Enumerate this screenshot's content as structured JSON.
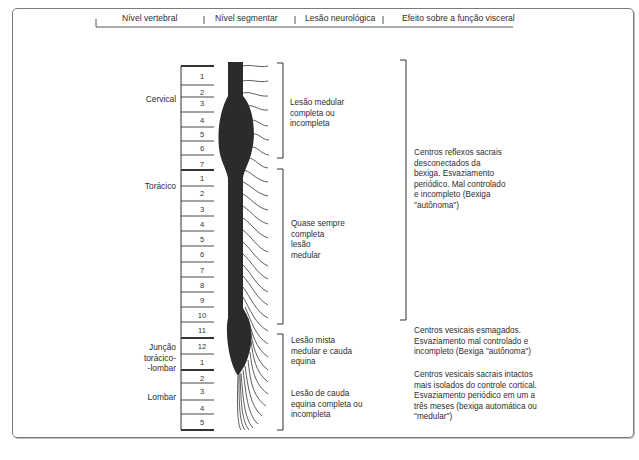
{
  "header": {
    "columns": [
      "Nível vertebral",
      "Nível segmentar",
      "Lesão neurológica",
      "Efeito sobre a função visceral"
    ]
  },
  "vertebral_regions": [
    {
      "label": "Cervical"
    },
    {
      "label": "Torácico"
    },
    {
      "label": "Junção torácico-lombar",
      "lines": [
        "Junção",
        "torácico-",
        "-lombar"
      ]
    },
    {
      "label": "Lombar"
    }
  ],
  "segments": {
    "cervical": [
      "1",
      "2",
      "3",
      "4",
      "5",
      "6",
      "7"
    ],
    "thoracic": [
      "1",
      "2",
      "3",
      "4",
      "5",
      "6",
      "7",
      "8",
      "9",
      "10",
      "11",
      "12"
    ],
    "lumbar": [
      "1",
      "2",
      "3",
      "4",
      "5"
    ]
  },
  "lesions": [
    {
      "id": "cervical",
      "lines": [
        "Lesão medular",
        "completa ou",
        "incompleta"
      ]
    },
    {
      "id": "thoracic",
      "lines": [
        "Quase sempre",
        "completa",
        "lesão",
        "medular"
      ]
    },
    {
      "id": "mixed",
      "lines": [
        "Lesão mista",
        "medular e cauda",
        "equina"
      ]
    },
    {
      "id": "cauda",
      "lines": [
        "Lesão de cauda",
        "equina completa ou",
        "incompleta"
      ]
    }
  ],
  "effects": [
    {
      "id": "upper",
      "lines": [
        "Centros reflexos sacrais",
        "desconectados da",
        "bexiga. Esvaziamento",
        "periódico. Mal controlado",
        "e incompleto (Bexiga",
        "\"autônoma\")"
      ]
    },
    {
      "id": "crushed",
      "lines": [
        "Centros vesicais esmagados.",
        "Esvaziamento mal controlado e",
        "incompleto (Bexiga \"autônoma\")"
      ]
    },
    {
      "id": "intact",
      "lines": [
        "Centros vesicais sacrais intactos",
        "mais isolados do controle cortical.",
        "Esvaziamento periódico em um a",
        "três meses (bexiga automática ou",
        "\"medular\")"
      ]
    }
  ],
  "colors": {
    "cord": "#2b2b2b",
    "lines": "#333333",
    "frame": "#7a7a7a"
  }
}
